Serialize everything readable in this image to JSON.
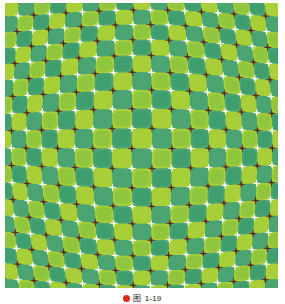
{
  "figure": {
    "name": "bulge-optical-illusion",
    "alt_title": "Bulging checkerboard optical illusion",
    "colors": {
      "light_green": "#a8cf38",
      "mid_green": "#8fc63d",
      "dark_green": "#4ba572",
      "teal_green": "#3f9e6e",
      "star_white": "#ffffff",
      "star_dark": "#5c2b22",
      "background": "#ffffff"
    },
    "grid": {
      "cols": 17,
      "rows": 18,
      "cell_px": 16.1,
      "bulge_strength": 0.26,
      "star_radius": 4.6
    }
  },
  "caption": {
    "bullet_icon": "red-dot-icon",
    "label": "图",
    "number": "1-19"
  }
}
